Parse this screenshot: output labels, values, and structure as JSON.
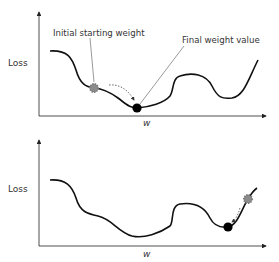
{
  "top_panel": {
    "y_label": "Loss",
    "x_label": "w",
    "annotation_start": "Initial starting weight",
    "annotation_final": "Final weight value"
  },
  "bottom_panel": {
    "y_label": "Loss",
    "x_label": "w"
  },
  "colors": {
    "curve": "#111111",
    "axis": "#222222",
    "start_marker": "#8a8a8a",
    "final_marker": "#000000"
  }
}
